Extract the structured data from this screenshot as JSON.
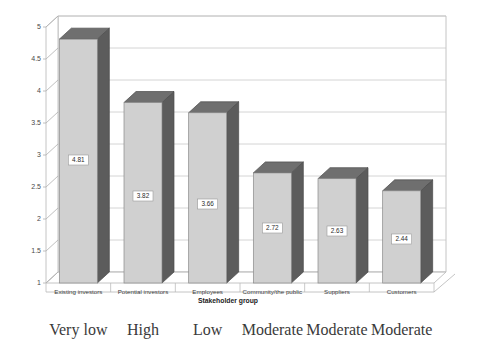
{
  "chart_data": {
    "type": "bar",
    "title": "",
    "subtitle": "",
    "xlabel": "Stakeholder group",
    "ylabel": "",
    "categories": [
      "Existing investors",
      "Potential investors",
      "Employees",
      "Community/the public",
      "Suppliers",
      "Customers"
    ],
    "values": [
      4.81,
      3.82,
      3.66,
      2.72,
      2.63,
      2.44
    ],
    "value_labels": [
      "4.81",
      "3.82",
      "3.66",
      "2.72",
      "2.63",
      "2.44"
    ],
    "annotations": [
      "Very low",
      "High",
      "Low",
      "Moderate",
      "Moderate",
      "Moderate"
    ],
    "ylim": [
      1,
      5
    ],
    "ytick_labels": [
      "1",
      "1.5",
      "2",
      "2.5",
      "3",
      "3.5",
      "4",
      "4.5",
      "5"
    ],
    "ytick_values": [
      1,
      1.5,
      2,
      2.5,
      3,
      3.5,
      4,
      4.5,
      5
    ],
    "grid": true,
    "legend": false,
    "legend_position": "none",
    "style": "3d-column",
    "colors": {
      "bar_front": "#d0d0d0",
      "bar_side": "#5c5c5c",
      "bar_top": "#6f6f6f",
      "gridline": "#c9c9c9",
      "frame": "#b5b5b5",
      "text": "#3d3d3d",
      "label_box_fill": "#ffffff",
      "background": "#ffffff"
    }
  }
}
